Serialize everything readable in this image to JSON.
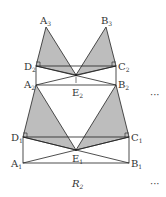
{
  "figure": {
    "labels": {
      "A3": {
        "base": "A",
        "sub": "3"
      },
      "B3": {
        "base": "B",
        "sub": "3"
      },
      "D2": {
        "base": "D",
        "sub": "2"
      },
      "C2": {
        "base": "C",
        "sub": "2"
      },
      "A2": {
        "base": "A",
        "sub": "2"
      },
      "B2": {
        "base": "B",
        "sub": "2"
      },
      "E2": {
        "base": "E",
        "sub": "2"
      },
      "D1": {
        "base": "D",
        "sub": "1"
      },
      "C1": {
        "base": "C",
        "sub": "1"
      },
      "A1": {
        "base": "A",
        "sub": "1"
      },
      "B1": {
        "base": "B",
        "sub": "1"
      },
      "E1": {
        "base": "E",
        "sub": "1"
      }
    },
    "caption": {
      "base": "R",
      "sub": "2"
    },
    "ellipsis_upper": "···",
    "ellipsis_lower": "···",
    "colors": {
      "shade": "#b8b8b8",
      "stroke": "#222222"
    }
  }
}
